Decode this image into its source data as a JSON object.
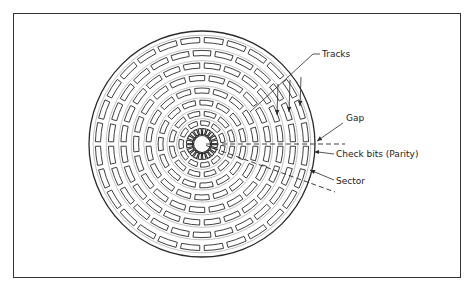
{
  "diagram": {
    "labels": {
      "tracks": "Tracks",
      "gap": "Gap",
      "check_bits": "Check bits (Parity)",
      "sector": "Sector"
    },
    "structure": {
      "sector_tracks": 8,
      "notched_inner_ring": true
    },
    "colors": {
      "line": "#2a2a2a",
      "track_separator": "#9a9a9a",
      "background": "#ffffff"
    }
  }
}
